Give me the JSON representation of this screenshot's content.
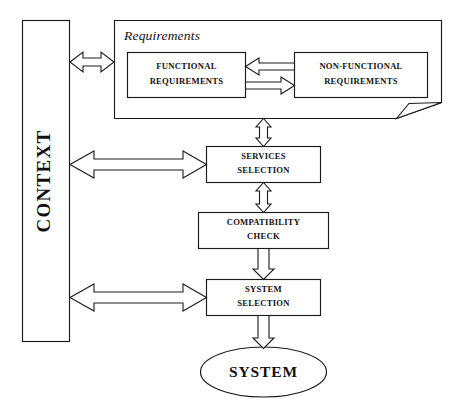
{
  "diagram": {
    "type": "flow-diagram",
    "background_color": "#ffffff",
    "line_color": "#1a1a1a",
    "nodes": {
      "context": {
        "label": "CONTEXT",
        "shape": "vertical-rectangle",
        "orientation": "rotated-90-ccw"
      },
      "requirements_container": {
        "label": "Requirements",
        "shape": "document-with-folded-corner",
        "label_style": "italic"
      },
      "functional_requirements": {
        "line1": "FUNCTIONAL",
        "line2": "REQUIREMENTS",
        "shape": "rectangle"
      },
      "non_functional_requirements": {
        "line1": "NON-FUNCTIONAL",
        "line2": "REQUIREMENTS",
        "shape": "rectangle"
      },
      "services_selection": {
        "line1": "SERVICES",
        "line2": "SELECTION",
        "shape": "rectangle"
      },
      "compatibility_check": {
        "line1": "COMPATIBILITY",
        "line2": "CHECK",
        "shape": "rectangle"
      },
      "system_selection": {
        "line1": "SYSTEM",
        "line2": "SELECTION",
        "shape": "rectangle"
      },
      "system": {
        "label": "SYSTEM",
        "shape": "ellipse"
      }
    },
    "connectors": [
      {
        "name": "context-to-requirements",
        "from": "context",
        "to": "requirements_container",
        "style": "block-arrow",
        "heads": "double",
        "direction": "horizontal"
      },
      {
        "name": "nonfunctional-to-functional",
        "from": "non_functional_requirements",
        "to": "functional_requirements",
        "style": "block-arrow",
        "heads": "single",
        "direction": "left"
      },
      {
        "name": "functional-to-nonfunctional",
        "from": "functional_requirements",
        "to": "non_functional_requirements",
        "style": "block-arrow",
        "heads": "single",
        "direction": "right"
      },
      {
        "name": "requirements-to-services-selection",
        "from": "requirements_container",
        "to": "services_selection",
        "style": "block-arrow",
        "heads": "double",
        "direction": "vertical"
      },
      {
        "name": "context-to-services-selection",
        "from": "context",
        "to": "services_selection",
        "style": "block-arrow",
        "heads": "double",
        "direction": "horizontal"
      },
      {
        "name": "services-selection-to-compatibility-check",
        "from": "services_selection",
        "to": "compatibility_check",
        "style": "block-arrow",
        "heads": "double",
        "direction": "vertical"
      },
      {
        "name": "compatibility-check-to-system-selection",
        "from": "compatibility_check",
        "to": "system_selection",
        "style": "block-arrow",
        "heads": "single",
        "direction": "down"
      },
      {
        "name": "context-to-system-selection",
        "from": "context",
        "to": "system_selection",
        "style": "block-arrow",
        "heads": "double",
        "direction": "horizontal"
      },
      {
        "name": "system-selection-to-system",
        "from": "system_selection",
        "to": "system",
        "style": "block-arrow",
        "heads": "single",
        "direction": "down"
      }
    ]
  }
}
